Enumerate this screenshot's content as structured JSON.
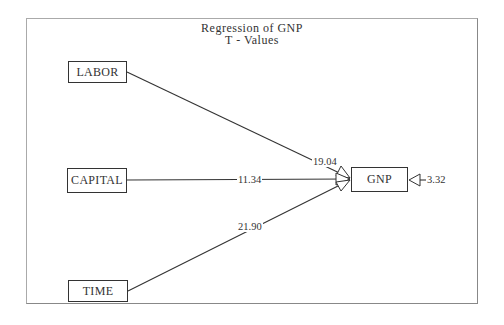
{
  "title": {
    "line1": "Regression   of   GNP",
    "line2": "T  -  Values"
  },
  "nodes": {
    "labor": "LABOR",
    "capital": "CAPITAL",
    "time": "TIME",
    "gnp": "GNP"
  },
  "paths": [
    {
      "from": "LABOR",
      "to": "GNP",
      "t_value": "19.04"
    },
    {
      "from": "CAPITAL",
      "to": "GNP",
      "t_value": "11.34"
    },
    {
      "from": "TIME",
      "to": "GNP",
      "t_value": "21.90"
    }
  ],
  "error_term": {
    "to": "GNP",
    "t_value": "3.32"
  }
}
